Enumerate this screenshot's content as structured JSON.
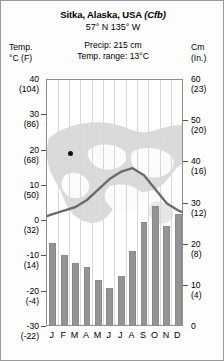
{
  "header": {
    "title_main": "Sitka, Alaska, USA",
    "title_koppen": "(Cfb)",
    "coordinates": "57° N 135° W",
    "precip_total": "Precip: 215 cm",
    "temp_range": "Temp. range: 13°C"
  },
  "left_axis": {
    "caption_line1": "Temp.",
    "caption_line2": "°C (F)"
  },
  "right_axis": {
    "caption_line1": "Cm",
    "caption_line2": "(In.)"
  },
  "colors": {
    "bar_fill": "#949494",
    "bar_stroke": "#8a8a8a",
    "curve": "#6b6b6b",
    "gridline": "#d8d8d8",
    "frame": "#8e8e8e",
    "map": "#d2d2d2",
    "dot": "#111111"
  },
  "chart_data": {
    "type": "bar",
    "title": "Sitka, Alaska, USA (Cfb)",
    "subtitle": "57° N 135° W",
    "annotations": [
      "Precip: 215 cm",
      "Temp. range: 13°C"
    ],
    "xlabel": "",
    "ylabel": "Temp. °C (F)",
    "y2label": "Cm (In.)",
    "grid": true,
    "legend": "none",
    "categories": [
      "J",
      "F",
      "M",
      "A",
      "M",
      "J",
      "J",
      "A",
      "S",
      "O",
      "N",
      "D"
    ],
    "month_labels": [
      "J",
      "F",
      "M",
      "A",
      "M",
      "J",
      "J",
      "A",
      "S",
      "O",
      "N",
      "D"
    ],
    "ylim": [
      -30,
      40
    ],
    "y2lim": [
      0,
      60
    ],
    "yticks_c": [
      40,
      30,
      20,
      10,
      0,
      -10,
      -20,
      -30
    ],
    "yticks_f": [
      104,
      86,
      68,
      50,
      32,
      14,
      -4,
      -22
    ],
    "ytick_labels_left": [
      {
        "c": "40",
        "f": "(104)"
      },
      {
        "c": "30",
        "f": "(86)"
      },
      {
        "c": "20",
        "f": "(68)"
      },
      {
        "c": "10",
        "f": "(50)"
      },
      {
        "c": "0",
        "f": "(32)"
      },
      {
        "c": "-10",
        "f": "(14)"
      },
      {
        "c": "-20",
        "f": "(-4)"
      },
      {
        "c": "-30",
        "f": "(-22)"
      }
    ],
    "y2ticks_cm": [
      60,
      50,
      40,
      30,
      20,
      10,
      0
    ],
    "ytick_labels_right": [
      {
        "cm": "60",
        "in": "(23)"
      },
      {
        "cm": "50",
        "in": "(20)"
      },
      {
        "cm": "40",
        "in": "(16)"
      },
      {
        "cm": "30",
        "in": "(12)"
      },
      {
        "cm": "20",
        "in": "(8)"
      },
      {
        "cm": "10",
        "in": "(4)"
      },
      {
        "cm": "0",
        "in": ""
      }
    ],
    "series": [
      {
        "name": "Precipitation",
        "unit": "cm",
        "chart_type": "bar",
        "axis": "right",
        "values": [
          20,
          17,
          15,
          14,
          11,
          9,
          12,
          18,
          25,
          29,
          24,
          27
        ]
      },
      {
        "name": "Temperature",
        "unit": "°C",
        "chart_type": "line",
        "axis": "left",
        "values": [
          2,
          3,
          4,
          6,
          9,
          12,
          14,
          15,
          13,
          9,
          5,
          3
        ]
      }
    ]
  },
  "map_marker": {
    "name": "sitka-location-dot",
    "label": ""
  }
}
